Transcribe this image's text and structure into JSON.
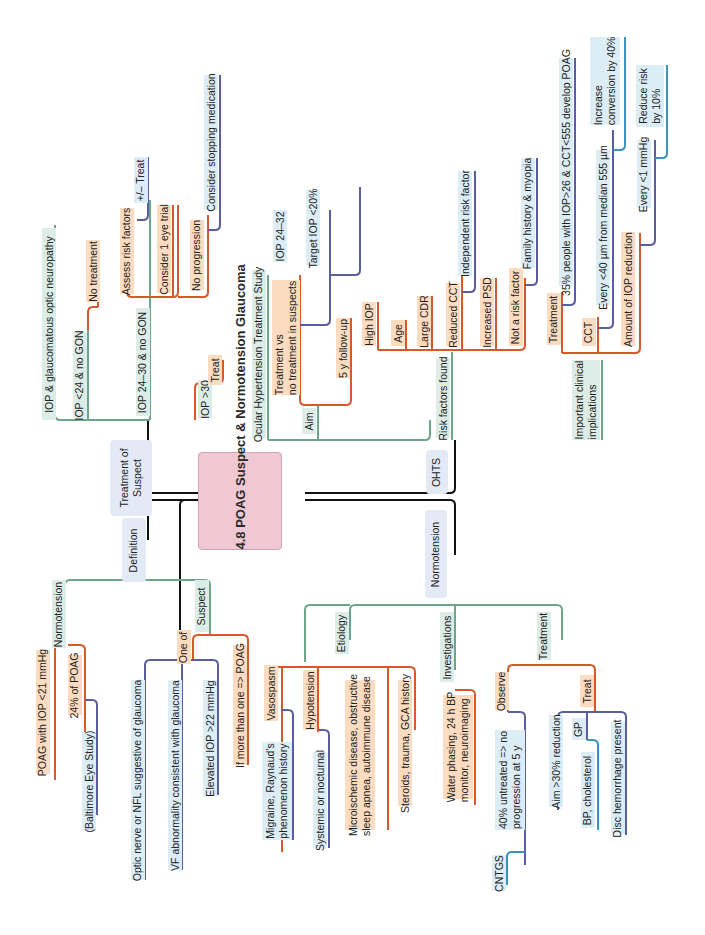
{
  "title": "4.8 POAG Suspect & Normotension Glaucoma",
  "colors": {
    "center_fill": "#efc8d3",
    "category_fill": "#e3e9f5",
    "level1_line": "#6fa58a",
    "level2_line": "#d9582a",
    "level3_line": "#5a5d9e",
    "level4_line": "#3a94bd",
    "orange_fill": "#fbdcc0",
    "blue_fill": "#dcedf6",
    "green_fill": "#dcece6"
  },
  "categories": {
    "treatment_of_suspect": "Treatment of\nSuspect",
    "definition": "Definition",
    "ohts": "OHTS",
    "normotension": "Normotension"
  },
  "treatment_of_suspect": {
    "gon": "IOP & glaucomatous optic neuropathy",
    "iop_lt24": "IOP <24 & no GON",
    "no_treatment": "No treatment",
    "iop_24_30": "IOP 24–30 & no GON",
    "assess_risk": "Assess risk factors",
    "plus_minus_treat": "+/– Treat",
    "one_eye_trial": "Consider 1 eye trial",
    "no_progression": "No progression",
    "stop_medication": "Consider stopping medication",
    "iop_gt30": "IOP >30",
    "treat": "Treat"
  },
  "definition": {
    "normotension": "Normotension",
    "poag_iop": "POAG with IOP <21 mmHg",
    "pct_poag": "24% of POAG",
    "baltimore": "(Baltimore Eye Study)",
    "suspect": "Suspect",
    "one_of": "One of",
    "optic_nerve": "Optic nerve or NFL suggestive of glaucoma",
    "vf_abnormality": "VF abnormality consistent with glaucoma",
    "elevated_iop": "Elevated IOP >22 mmHg",
    "more_than_one": "If more than one => POAG"
  },
  "ohts": {
    "study": "Ocular Hypertension Treatment Study",
    "aim": "Aim",
    "treatment_vs": "Treatment vs\nno treatment in suspects",
    "iop_24_32": "IOP 24–32",
    "target_iop": "Target IOP <20%",
    "follow_up": "5 y follow-up",
    "risk_factors": "Risk factors found",
    "high_iop": "High IOP",
    "age": "Age",
    "large_cdr": "Large CDR",
    "reduced_cct": "Reduced CCT",
    "independent": "Independent risk factor",
    "increased_psd": "Increased PSD",
    "not_risk": "Not a risk factor",
    "family_history": "Family history & myopia",
    "implications": "Important clinical\nimplications",
    "treatment": "Treatment",
    "develop_poag": "35% people with IOP>26 & CCT<555 develop POAG",
    "cct": "CCT",
    "every_40": "Every <40 µm from median 555 µm",
    "increase_conversion": "Increase\nconversion by 40%",
    "iop_reduction": "Amount of IOP reduction",
    "every_1": "Every <1 mmHg",
    "reduce_risk": "Reduce risk\nby 10%"
  },
  "normotension": {
    "etiology": "Etiology",
    "vasospasm": "Vasospasm",
    "migraine": "Migraine, Raynaud's\nphenomenon history",
    "hypotension": "Hypotension",
    "systemic": "Systemic or nocturnal",
    "microischemic": "Microischemic disease, obstructive\nsleep apnea, autoimmune disease",
    "steroids": "Steroids, trauma, GCA history",
    "investigations": "Investigations",
    "water_phasing": "Water phasing, 24 h BP\nmonitor, neuroimaging",
    "treatment": "Treatment",
    "observe": "Observe",
    "untreated": "40% untreated => no\nprogression at 5 y",
    "cntgs": "CNTGS",
    "treat": "Treat",
    "aim_reduction": "Aim >30% reduction",
    "gp": "GP",
    "bp_cholesterol": "BP, cholesterol",
    "disc_hemorrhage": "Disc hemorrhage present"
  }
}
